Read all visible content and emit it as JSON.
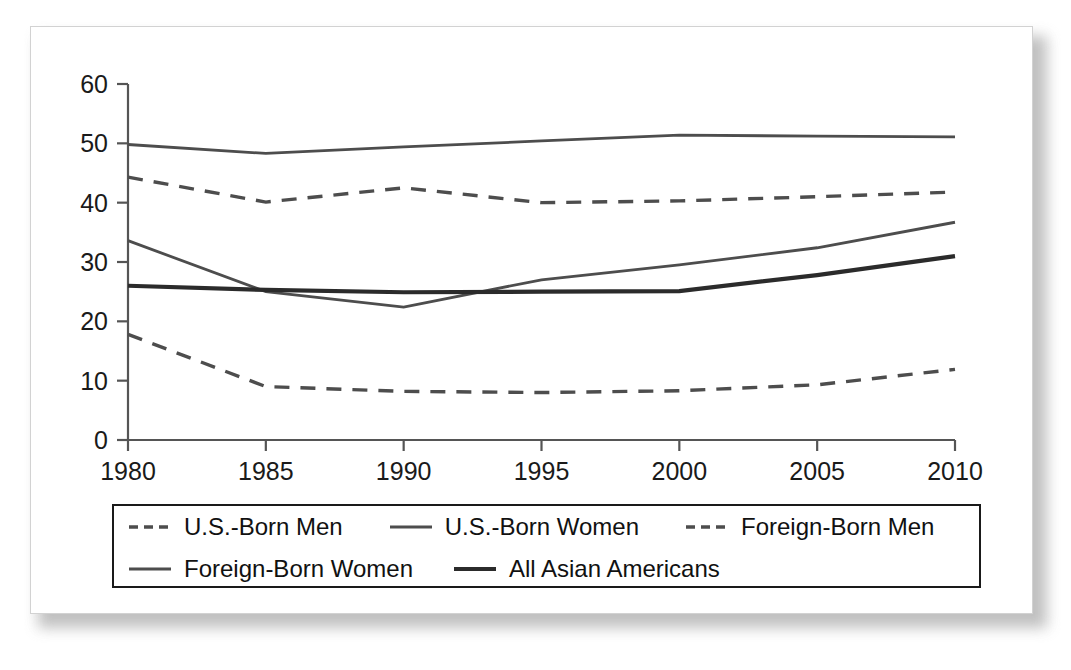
{
  "chart_data": {
    "type": "line",
    "title": "",
    "subtitle": "",
    "xlabel": "",
    "ylabel": "",
    "x": [
      1980,
      1985,
      1990,
      1995,
      2000,
      2005,
      2010
    ],
    "xtick_labels": [
      "1980",
      "1985",
      "1990",
      "1995",
      "2000",
      "2005",
      "2010"
    ],
    "ytick_labels": [
      "0",
      "10",
      "20",
      "30",
      "40",
      "50",
      "60"
    ],
    "yticks": [
      0,
      10,
      20,
      30,
      40,
      50,
      60
    ],
    "ylim": [
      0,
      60
    ],
    "xlim": [
      1980,
      2010
    ],
    "grid": false,
    "legend_position": "below-axes",
    "series": [
      {
        "name": "U.S.-Born Men",
        "style": "dashed",
        "color": "#4d4d4d",
        "width": 3.4,
        "values": [
          44.3,
          40.1,
          42.5,
          40.0,
          40.3,
          41.0,
          41.8
        ]
      },
      {
        "name": "U.S.-Born Women",
        "style": "solid",
        "color": "#4d4d4d",
        "width": 2.8,
        "values": [
          49.8,
          48.3,
          49.4,
          50.4,
          51.4,
          51.2,
          51.1
        ]
      },
      {
        "name": "Foreign-Born Men",
        "style": "dashed",
        "color": "#4d4d4d",
        "width": 3.4,
        "values": [
          17.8,
          9.0,
          8.2,
          8.0,
          8.3,
          9.3,
          11.9
        ]
      },
      {
        "name": "Foreign-Born Women",
        "style": "solid",
        "color": "#4d4d4d",
        "width": 2.8,
        "values": [
          33.6,
          25.0,
          22.4,
          27.0,
          29.5,
          32.4,
          36.7
        ]
      },
      {
        "name": "All Asian Americans",
        "style": "solid",
        "color": "#2b2b2b",
        "width": 4.2,
        "values": [
          26.0,
          25.3,
          24.9,
          25.0,
          25.1,
          27.8,
          31.0
        ]
      }
    ]
  },
  "legend": {
    "rows": [
      [
        {
          "label": "U.S.-Born Men",
          "style": "dashed",
          "width": 3.4,
          "color": "#4d4d4d"
        },
        {
          "label": "U.S.-Born Women",
          "style": "solid",
          "width": 2.8,
          "color": "#4d4d4d"
        },
        {
          "label": "Foreign-Born Men",
          "style": "dashed",
          "width": 3.4,
          "color": "#4d4d4d"
        }
      ],
      [
        {
          "label": "Foreign-Born Women",
          "style": "solid",
          "width": 2.8,
          "color": "#4d4d4d"
        },
        {
          "label": "All Asian Americans",
          "style": "solid",
          "width": 4.2,
          "color": "#2b2b2b"
        }
      ]
    ]
  },
  "colors": {
    "background": "#ffffff",
    "card_border": "#d2d2d2",
    "axis": "#555555",
    "text": "#1a1a1a",
    "legend_border": "#1a1a1a",
    "shadow": "#b6b6b6"
  }
}
